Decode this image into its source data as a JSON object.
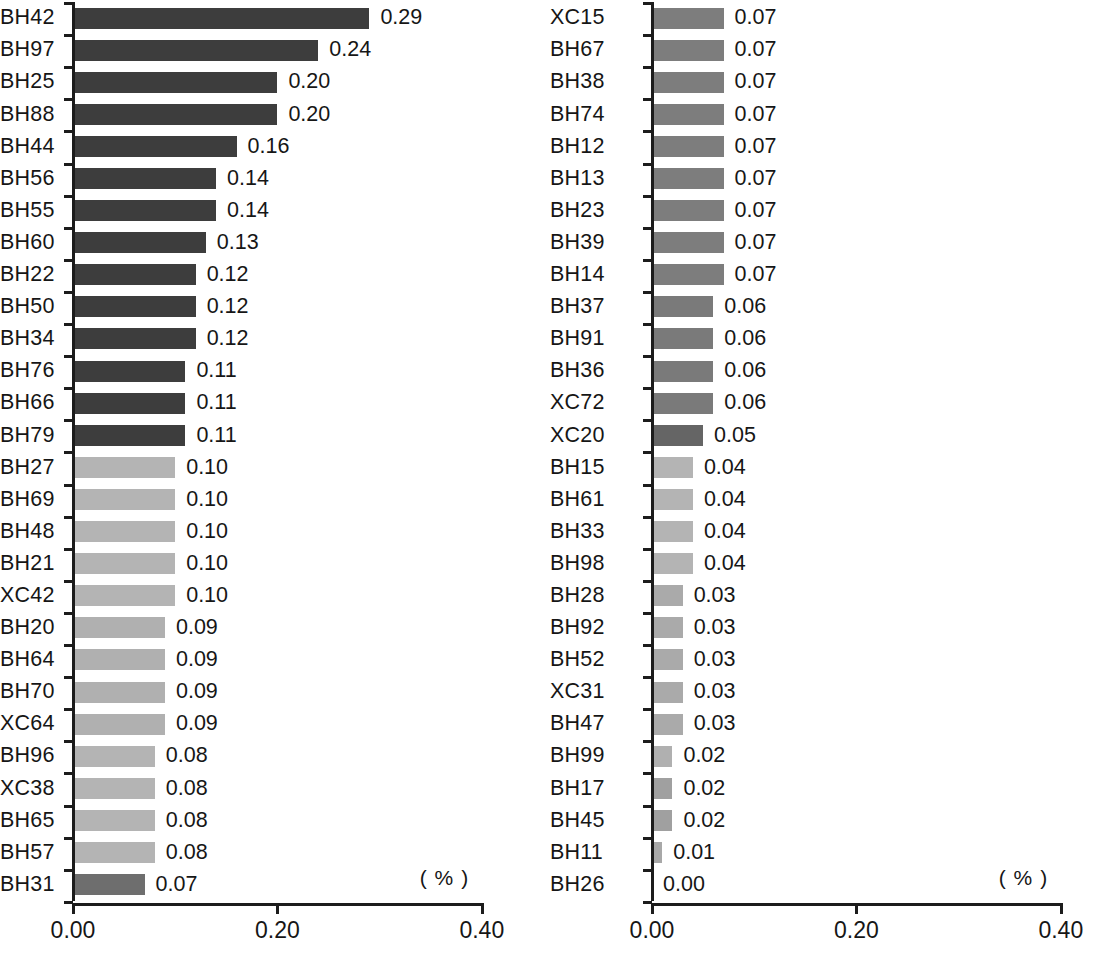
{
  "chart_data": {
    "type": "bar",
    "orientation": "horizontal",
    "title": "",
    "subtitle": "",
    "xlabel": "( % )",
    "ylabel": "",
    "xlim": [
      0.0,
      0.4
    ],
    "xticks": [
      "0.00",
      "0.20",
      "0.40"
    ],
    "xtick_values": [
      0.0,
      0.2,
      0.4
    ],
    "grid": false,
    "legend": null,
    "unit_annotation": "( % )",
    "panels": [
      {
        "name": "left-panel",
        "categories": [
          "BH42",
          "BH97",
          "BH25",
          "BH88",
          "BH44",
          "BH56",
          "BH55",
          "BH60",
          "BH22",
          "BH50",
          "BH34",
          "BH76",
          "BH66",
          "BH79",
          "BH27",
          "BH69",
          "BH48",
          "BH21",
          "XC42",
          "BH20",
          "BH64",
          "BH70",
          "XC64",
          "BH96",
          "XC38",
          "BH65",
          "BH57",
          "BH31"
        ],
        "values": [
          0.29,
          0.24,
          0.2,
          0.2,
          0.16,
          0.14,
          0.14,
          0.13,
          0.12,
          0.12,
          0.12,
          0.11,
          0.11,
          0.11,
          0.1,
          0.1,
          0.1,
          0.1,
          0.1,
          0.09,
          0.09,
          0.09,
          0.09,
          0.08,
          0.08,
          0.08,
          0.08,
          0.07
        ],
        "labels": [
          "0.29",
          "0.24",
          "0.20",
          "0.20",
          "0.16",
          "0.14",
          "0.14",
          "0.13",
          "0.12",
          "0.12",
          "0.12",
          "0.11",
          "0.11",
          "0.11",
          "0.10",
          "0.10",
          "0.10",
          "0.10",
          "0.10",
          "0.09",
          "0.09",
          "0.09",
          "0.09",
          "0.08",
          "0.08",
          "0.08",
          "0.08",
          "0.07"
        ],
        "bar_colors": [
          "#3d3d3d",
          "#3d3d3d",
          "#3d3d3d",
          "#3d3d3d",
          "#3d3d3d",
          "#3d3d3d",
          "#3d3d3d",
          "#3d3d3d",
          "#3d3d3d",
          "#3d3d3d",
          "#3d3d3d",
          "#3d3d3d",
          "#3d3d3d",
          "#3d3d3d",
          "#b4b4b4",
          "#b4b4b4",
          "#b4b4b4",
          "#b4b4b4",
          "#b4b4b4",
          "#b0b0b0",
          "#b0b0b0",
          "#b0b0b0",
          "#b0b0b0",
          "#b4b4b4",
          "#b4b4b4",
          "#b4b4b4",
          "#b4b4b4",
          "#6e6e6e"
        ]
      },
      {
        "name": "right-panel",
        "categories": [
          "XC15",
          "BH67",
          "BH38",
          "BH74",
          "BH12",
          "BH13",
          "BH23",
          "BH39",
          "BH14",
          "BH37",
          "BH91",
          "BH36",
          "XC72",
          "XC20",
          "BH15",
          "BH61",
          "BH33",
          "BH98",
          "BH28",
          "BH92",
          "BH52",
          "XC31",
          "BH47",
          "BH99",
          "BH17",
          "BH45",
          "BH11",
          "BH26"
        ],
        "values": [
          0.07,
          0.07,
          0.07,
          0.07,
          0.07,
          0.07,
          0.07,
          0.07,
          0.07,
          0.06,
          0.06,
          0.06,
          0.06,
          0.05,
          0.04,
          0.04,
          0.04,
          0.04,
          0.03,
          0.03,
          0.03,
          0.03,
          0.03,
          0.02,
          0.02,
          0.02,
          0.01,
          0.0
        ],
        "labels": [
          "0.07",
          "0.07",
          "0.07",
          "0.07",
          "0.07",
          "0.07",
          "0.07",
          "0.07",
          "0.07",
          "0.06",
          "0.06",
          "0.06",
          "0.06",
          "0.05",
          "0.04",
          "0.04",
          "0.04",
          "0.04",
          "0.03",
          "0.03",
          "0.03",
          "0.03",
          "0.03",
          "0.02",
          "0.02",
          "0.02",
          "0.01",
          "0.00"
        ],
        "bar_colors": [
          "#7d7d7d",
          "#7d7d7d",
          "#7d7d7d",
          "#7d7d7d",
          "#7d7d7d",
          "#7d7d7d",
          "#7d7d7d",
          "#7d7d7d",
          "#7d7d7d",
          "#7a7a7a",
          "#7a7a7a",
          "#7a7a7a",
          "#7a7a7a",
          "#656565",
          "#b4b4b4",
          "#b4b4b4",
          "#b4b4b4",
          "#b4b4b4",
          "#aaaaaa",
          "#aaaaaa",
          "#aaaaaa",
          "#aaaaaa",
          "#aaaaaa",
          "#b0b0b0",
          "#a0a0a0",
          "#a0a0a0",
          "#a8a8a8",
          "#ffffff"
        ]
      }
    ],
    "colors": {
      "bar_dark": "#3d3d3d",
      "bar_medium": "#7d7d7d",
      "bar_light": "#b4b4b4",
      "axis": "#1c1c1c",
      "text": "#161616",
      "background": "#ffffff"
    }
  }
}
